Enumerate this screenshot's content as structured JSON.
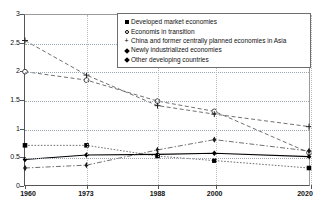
{
  "chart_data": {
    "type": "line",
    "title": "",
    "xlabel": "",
    "ylabel": "",
    "x": [
      1960,
      1973,
      1988,
      2000,
      2020
    ],
    "categories": [
      "1960",
      "1973",
      "1988",
      "2000",
      "2020"
    ],
    "xlim": [
      1960,
      2020
    ],
    "ylim": [
      0,
      3
    ],
    "yticks": [
      "0",
      "0.5",
      "1",
      "1.5",
      "2",
      "2.5",
      "3"
    ],
    "ytick_values": [
      0,
      0.5,
      1,
      1.5,
      2,
      2.5,
      3
    ],
    "grid": "horizontal-dotted",
    "legend_position": "top-right-inside",
    "series": [
      {
        "name": "Developed market economies",
        "marker": "filled-square",
        "linestyle": "dotted",
        "values": [
          0.7,
          0.7,
          0.51,
          0.43,
          0.3
        ]
      },
      {
        "name": "Economis in transition",
        "marker": "open-circle",
        "linestyle": "dashed",
        "values": [
          2.0,
          1.85,
          1.48,
          1.3,
          0.57
        ]
      },
      {
        "name": "China and former centrally planned economies in Asia",
        "marker": "plus",
        "linestyle": "dashed",
        "values": [
          2.55,
          1.94,
          1.4,
          1.25,
          1.03
        ]
      },
      {
        "name": "Newly industrialized economies",
        "marker": "filled-diamond",
        "linestyle": "solid",
        "values": [
          0.45,
          0.53,
          0.54,
          0.56,
          0.5
        ]
      },
      {
        "name": "Other developing countries",
        "marker": "sharp-diamond",
        "linestyle": "dash-dot",
        "values": [
          0.3,
          0.35,
          0.62,
          0.8,
          0.6
        ]
      }
    ]
  },
  "legend": {
    "items": [
      {
        "marker_name": "filled-square-marker",
        "label": "Developed market economies"
      },
      {
        "marker_name": "open-circle-marker",
        "label": "Economis in transition"
      },
      {
        "marker_name": "plus-marker",
        "label": "China and former centrally planned economies in Asia"
      },
      {
        "marker_name": "diamond-marker",
        "label": "Newly industrialized economies"
      },
      {
        "marker_name": "sharp-diamond-marker",
        "label": "Other developing countries"
      }
    ]
  }
}
